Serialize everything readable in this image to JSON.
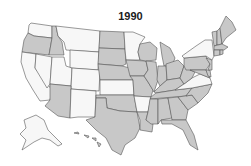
{
  "map": {
    "title": "1990",
    "colors": {
      "shaded": "#c8c8c8",
      "unshaded": "#f7f7f7",
      "border": "#555555"
    },
    "unshaded_states": [
      "WA",
      "MT",
      "WY",
      "NV",
      "CA",
      "UT",
      "CO",
      "NM",
      "KS",
      "MN",
      "AR",
      "NY",
      "VA",
      "AK"
    ],
    "shaded_states": [
      "OR",
      "ID",
      "ND",
      "SD",
      "NE",
      "AZ",
      "TX",
      "OK",
      "IA",
      "MO",
      "WI",
      "IL",
      "MI",
      "IN",
      "OH",
      "KY",
      "TN",
      "WV",
      "PA",
      "MD",
      "DE",
      "NJ",
      "LA",
      "MS",
      "AL",
      "GA",
      "FL",
      "SC",
      "NC",
      "ME",
      "VT",
      "NH",
      "MA",
      "CT",
      "RI",
      "HI"
    ]
  }
}
